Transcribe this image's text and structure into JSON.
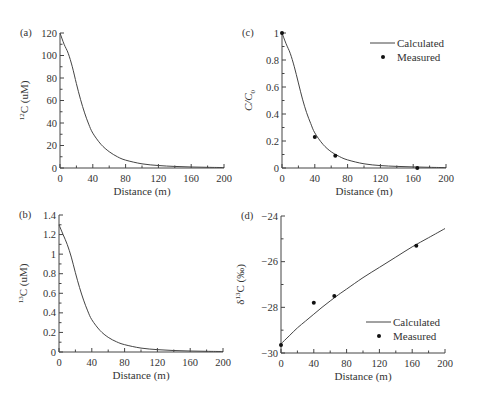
{
  "chart_data": [
    {
      "id": "a",
      "type": "line",
      "panel_label": "(a)",
      "xlabel": "Distance (m)",
      "ylabel_sup": "12",
      "ylabel_main": "C (uM)",
      "xlim": [
        0,
        200
      ],
      "ylim": [
        0,
        120
      ],
      "xticks": [
        0,
        40,
        80,
        120,
        160,
        200
      ],
      "yticks": [
        0,
        20,
        40,
        60,
        80,
        100,
        120
      ],
      "x_minor_step": 20,
      "y_minor_step": 10,
      "frame": {
        "x0": 60,
        "x1": 224,
        "y0": 168,
        "y1": 33
      },
      "series": [
        {
          "name": "Calculated",
          "style": "line",
          "x": [
            0,
            5,
            10,
            15,
            20,
            25,
            30,
            35,
            40,
            50,
            60,
            70,
            80,
            100,
            120,
            140,
            160,
            180,
            200
          ],
          "y": [
            120,
            110,
            102,
            90,
            75,
            61,
            49,
            39,
            31,
            21,
            14.5,
            10,
            7,
            3.7,
            2.2,
            1.4,
            0.9,
            0.6,
            0.4
          ]
        }
      ]
    },
    {
      "id": "c",
      "type": "line",
      "panel_label": "(c)",
      "xlabel": "Distance (m)",
      "ylabel_main": "C/C",
      "ylabel_sub": "0",
      "xlim": [
        0,
        200
      ],
      "ylim": [
        0,
        1
      ],
      "xticks": [
        0,
        40,
        80,
        120,
        160,
        200
      ],
      "yticks": [
        0,
        0.2,
        0.4,
        0.6,
        0.8,
        1
      ],
      "ytick_labels": [
        "0",
        "0.2",
        "0.4",
        "0.6",
        "0.8",
        "1"
      ],
      "x_minor_step": 20,
      "y_minor_step": 0.1,
      "frame": {
        "x0": 282,
        "x1": 446,
        "y0": 168,
        "y1": 33
      },
      "legend": {
        "position": "upper right",
        "entries": [
          "Calculated",
          "Measured"
        ]
      },
      "series": [
        {
          "name": "Calculated",
          "style": "line",
          "x": [
            0,
            5,
            10,
            15,
            20,
            25,
            30,
            35,
            40,
            50,
            60,
            70,
            80,
            100,
            120,
            140,
            160,
            180,
            200
          ],
          "y": [
            1.0,
            0.92,
            0.85,
            0.75,
            0.63,
            0.51,
            0.41,
            0.33,
            0.26,
            0.175,
            0.12,
            0.085,
            0.06,
            0.031,
            0.018,
            0.012,
            0.008,
            0.005,
            0.003
          ]
        },
        {
          "name": "Measured",
          "style": "points",
          "x": [
            0,
            40,
            65,
            165
          ],
          "y": [
            1.0,
            0.23,
            0.09,
            0.0
          ]
        }
      ]
    },
    {
      "id": "b",
      "type": "line",
      "panel_label": "(b)",
      "xlabel": "Distance (m)",
      "ylabel_sup": "13",
      "ylabel_main": "C (uM)",
      "xlim": [
        0,
        200
      ],
      "ylim": [
        0,
        1.4
      ],
      "xticks": [
        0,
        40,
        80,
        120,
        160,
        200
      ],
      "yticks": [
        0,
        0.2,
        0.4,
        0.6,
        0.8,
        1,
        1.2,
        1.4
      ],
      "ytick_labels": [
        "0",
        "0.2",
        "0.4",
        "0.6",
        "0.8",
        "1",
        "1.2",
        "1.4"
      ],
      "x_minor_step": 20,
      "y_minor_step": 0.1,
      "frame": {
        "x0": 59,
        "x1": 223,
        "y0": 352,
        "y1": 215
      },
      "series": [
        {
          "name": "Calculated",
          "style": "line",
          "x": [
            0,
            5,
            10,
            15,
            20,
            25,
            30,
            35,
            40,
            50,
            60,
            70,
            80,
            100,
            120,
            140,
            160,
            180,
            200
          ],
          "y": [
            1.3,
            1.2,
            1.1,
            0.97,
            0.81,
            0.66,
            0.53,
            0.42,
            0.33,
            0.22,
            0.15,
            0.105,
            0.075,
            0.04,
            0.024,
            0.015,
            0.01,
            0.007,
            0.005
          ]
        }
      ]
    },
    {
      "id": "d",
      "type": "line",
      "panel_label": "(d)",
      "xlabel": "Distance (m)",
      "ylabel_main": "δ",
      "ylabel_sup": "13",
      "ylabel_rest": "C (‰)",
      "xlim": [
        0,
        200
      ],
      "ylim": [
        -30,
        -24
      ],
      "xticks": [
        0,
        40,
        80,
        120,
        160,
        200
      ],
      "yticks": [
        -30,
        -28,
        -26,
        -24
      ],
      "ytick_labels": [
        "−30",
        "−28",
        "−26",
        "−24"
      ],
      "x_minor_step": 20,
      "y_minor_step": 1,
      "frame": {
        "x0": 281,
        "x1": 445,
        "y0": 353,
        "y1": 216
      },
      "legend": {
        "position": "lower right",
        "entries": [
          "Calculated",
          "Measured"
        ]
      },
      "series": [
        {
          "name": "Calculated",
          "style": "line",
          "x": [
            0,
            10,
            20,
            30,
            40,
            50,
            60,
            70,
            80,
            100,
            120,
            140,
            160,
            180,
            200
          ],
          "y": [
            -29.6,
            -29.25,
            -28.9,
            -28.6,
            -28.3,
            -28.0,
            -27.72,
            -27.45,
            -27.2,
            -26.7,
            -26.25,
            -25.8,
            -25.35,
            -24.95,
            -24.55
          ]
        },
        {
          "name": "Measured",
          "style": "points",
          "x": [
            0,
            40,
            65,
            165
          ],
          "y": [
            -29.65,
            -27.8,
            -27.5,
            -25.3
          ]
        }
      ]
    }
  ]
}
